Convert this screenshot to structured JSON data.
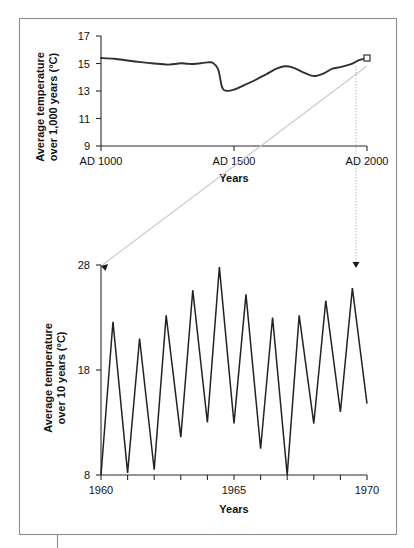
{
  "figure": {
    "name": "nested-temperature-timescale-figure",
    "background": "#ffffff",
    "frame_color": "#8e8e8e",
    "curve_color": "#303030",
    "connector_color": "#c9c9c9"
  },
  "chart_data": [
    {
      "id": "top",
      "type": "line",
      "title": "",
      "xlabel": "Years",
      "ylabel": "Average temperature over 1,000 years (°C)",
      "ylabel_line1": "Average temperature",
      "ylabel_line2": "over 1,000 years (°C)",
      "xlim": [
        1000,
        2000
      ],
      "ylim": [
        9,
        17
      ],
      "xticks": [
        1000,
        1500,
        2000
      ],
      "xticklabels": [
        "AD 1000",
        "AD 1500",
        "AD 2000"
      ],
      "yticks": [
        9,
        11,
        13,
        15,
        17
      ],
      "yticklabels": [
        "9",
        "11",
        "13",
        "15",
        "17"
      ],
      "grid": false,
      "legend": "none",
      "marker_at": {
        "x": 2000,
        "y": 15.4,
        "shape": "open-square"
      },
      "x": [
        1000,
        1050,
        1100,
        1150,
        1200,
        1250,
        1275,
        1300,
        1325,
        1350,
        1375,
        1400,
        1420,
        1440,
        1455,
        1470,
        1500,
        1540,
        1580,
        1620,
        1660,
        1690,
        1720,
        1760,
        1790,
        1810,
        1840,
        1870,
        1900,
        1940,
        1970,
        2000
      ],
      "values": [
        15.4,
        15.35,
        15.22,
        15.1,
        15.0,
        14.92,
        14.96,
        15.02,
        14.98,
        14.96,
        15.02,
        15.08,
        15.05,
        14.6,
        13.3,
        13.02,
        13.1,
        13.45,
        13.8,
        14.2,
        14.62,
        14.8,
        14.72,
        14.36,
        14.12,
        14.1,
        14.3,
        14.62,
        14.74,
        14.95,
        15.25,
        15.4
      ]
    },
    {
      "id": "bottom",
      "type": "line",
      "title": "",
      "xlabel": "Years",
      "ylabel": "Average temperature over 10 years (°C)",
      "ylabel_line1": "Average temperature",
      "ylabel_line2": "over 10 years (°C)",
      "xlim": [
        1960,
        1970
      ],
      "ylim": [
        8,
        28
      ],
      "xticks": [
        1960,
        1961,
        1962,
        1963,
        1964,
        1965,
        1966,
        1967,
        1968,
        1969,
        1970
      ],
      "xticklabels_shown": [
        "1960",
        "1965",
        "1970"
      ],
      "xticklabel_positions": [
        1960,
        1965,
        1970
      ],
      "yticks": [
        8,
        18,
        28
      ],
      "yticklabels": [
        "8",
        "18",
        "28"
      ],
      "grid": false,
      "legend": "none",
      "x": [
        1960.0,
        1960.45,
        1961.0,
        1961.45,
        1962.0,
        1962.45,
        1963.0,
        1963.45,
        1964.0,
        1964.45,
        1965.0,
        1965.45,
        1966.0,
        1966.45,
        1967.0,
        1967.45,
        1968.0,
        1968.45,
        1969.0,
        1969.45,
        1970.0
      ],
      "values": [
        8.0,
        22.6,
        8.2,
        21.0,
        8.5,
        23.2,
        11.6,
        25.6,
        13.0,
        27.8,
        12.9,
        25.2,
        10.5,
        23.0,
        8.0,
        23.2,
        12.9,
        24.6,
        14.0,
        25.8,
        14.8
      ],
      "peaks": [
        22.6,
        21.0,
        23.2,
        25.6,
        27.8,
        25.2,
        23.0,
        23.2,
        24.6,
        25.8
      ],
      "valleys": [
        8.0,
        8.2,
        8.5,
        11.6,
        13.0,
        12.9,
        10.5,
        8.0,
        12.9,
        14.0,
        14.8
      ]
    }
  ],
  "connectors": {
    "diagonal_label": "zoom-link-diagonal",
    "vertical_label": "zoom-link-vertical",
    "arrow_left": "arrow-to-bottom-left",
    "arrow_right": "arrow-to-bottom-right"
  }
}
